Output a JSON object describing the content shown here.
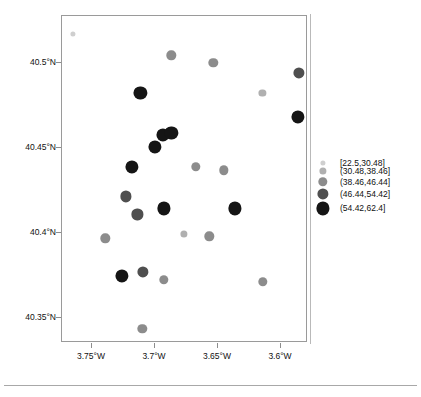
{
  "chart_data": {
    "type": "scatter",
    "title": "",
    "subtitle": "",
    "xlabel": "",
    "ylabel": "",
    "projection": "geographic",
    "grid": false,
    "xlim": [
      -3.775,
      -3.5755
    ],
    "ylim": [
      40.3315,
      40.5234
    ],
    "xtick_values": [
      -3.75,
      -3.7,
      -3.65,
      -3.6
    ],
    "xtick_labels": [
      "3.75°W",
      "3.7°W",
      "3.65°W",
      "3.6°W"
    ],
    "ytick_values": [
      40.5,
      40.45,
      40.4,
      40.35
    ],
    "ytick_labels": [
      "40.5°N",
      "40.45°N",
      "40.4°N",
      "40.35°N"
    ],
    "legend": {
      "position": "right",
      "title": "",
      "entries": [
        {
          "label": "[22.5,30.48]",
          "color": "#cfcfcf",
          "radius_px": 2.6,
          "class_index": 0
        },
        {
          "label": "(30.48,38.46]",
          "color": "#b0b0b0",
          "radius_px": 3.6,
          "class_index": 1
        },
        {
          "label": "(38.46,46.44]",
          "color": "#8c8c8c",
          "radius_px": 4.7,
          "class_index": 2
        },
        {
          "label": "(46.44,54.42]",
          "color": "#4f4f4f",
          "radius_px": 5.6,
          "class_index": 3
        },
        {
          "label": "(54.42,62.4]",
          "color": "#151515",
          "radius_px": 6.6,
          "class_index": 4
        }
      ]
    },
    "points": [
      {
        "x": -3.7664,
        "y": 40.5126,
        "class_index": 0,
        "value": 26.5
      },
      {
        "x": -3.6855,
        "y": 40.5003,
        "class_index": 2,
        "value": 42.4
      },
      {
        "x": -3.7109,
        "y": 40.478,
        "class_index": 4,
        "value": 58.1
      },
      {
        "x": -3.6514,
        "y": 40.4957,
        "class_index": 2,
        "value": 43.8
      },
      {
        "x": -3.5816,
        "y": 40.4898,
        "class_index": 3,
        "value": 50.2
      },
      {
        "x": -3.6111,
        "y": 40.478,
        "class_index": 1,
        "value": 35.1
      },
      {
        "x": -3.5824,
        "y": 40.4639,
        "class_index": 4,
        "value": 57.6
      },
      {
        "x": -3.6926,
        "y": 40.4533,
        "class_index": 4,
        "value": 56.3
      },
      {
        "x": -3.6855,
        "y": 40.4545,
        "class_index": 4,
        "value": 59.0
      },
      {
        "x": -3.699,
        "y": 40.4463,
        "class_index": 4,
        "value": 55.4
      },
      {
        "x": -3.7181,
        "y": 40.4345,
        "class_index": 4,
        "value": 60.2
      },
      {
        "x": -3.6426,
        "y": 40.4322,
        "class_index": 2,
        "value": 41.0
      },
      {
        "x": -3.7229,
        "y": 40.4169,
        "class_index": 3,
        "value": 48.7
      },
      {
        "x": -3.7133,
        "y": 40.4063,
        "class_index": 3,
        "value": 47.5
      },
      {
        "x": -3.6918,
        "y": 40.4098,
        "class_index": 4,
        "value": 61.3
      },
      {
        "x": -3.6656,
        "y": 40.4345,
        "class_index": 2,
        "value": 44.1
      },
      {
        "x": -3.6339,
        "y": 40.4098,
        "class_index": 4,
        "value": 58.8
      },
      {
        "x": -3.6545,
        "y": 40.3933,
        "class_index": 2,
        "value": 39.5
      },
      {
        "x": -3.7395,
        "y": 40.3922,
        "class_index": 2,
        "value": 40.6
      },
      {
        "x": -3.726,
        "y": 40.3698,
        "class_index": 4,
        "value": 62.0
      },
      {
        "x": -3.6918,
        "y": 40.3675,
        "class_index": 2,
        "value": 43.0
      },
      {
        "x": -3.6751,
        "y": 40.3945,
        "class_index": 1,
        "value": 33.8
      },
      {
        "x": -3.6109,
        "y": 40.3663,
        "class_index": 2,
        "value": 42.2
      },
      {
        "x": -3.7086,
        "y": 40.3722,
        "class_index": 3,
        "value": 0
      },
      {
        "x": -3.7094,
        "y": 40.3386,
        "class_index": 2,
        "value": 41.7
      }
    ]
  }
}
